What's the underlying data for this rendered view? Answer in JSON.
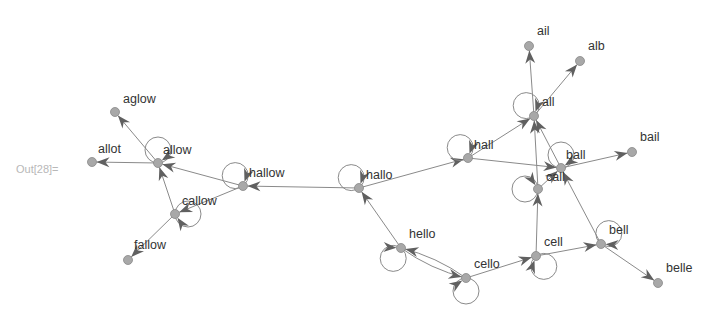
{
  "cell_label": "Out[28]=",
  "graph": {
    "nodes": [
      {
        "id": "aglow",
        "label": "aglow",
        "x": 115,
        "y": 112,
        "lx": 8,
        "ly": -9,
        "loop": null
      },
      {
        "id": "allot",
        "label": "allot",
        "x": 92,
        "y": 162,
        "lx": 6,
        "ly": -9,
        "loop": null
      },
      {
        "id": "allow",
        "label": "allow",
        "x": 158,
        "y": 163,
        "lx": 5,
        "ly": -9,
        "loop": "up"
      },
      {
        "id": "hallow",
        "label": "hallow",
        "x": 243,
        "y": 186,
        "lx": 6,
        "ly": -9,
        "loop": "upleft"
      },
      {
        "id": "callow",
        "label": "callow",
        "x": 175,
        "y": 214,
        "lx": 7,
        "ly": -9,
        "loop": "right"
      },
      {
        "id": "fallow",
        "label": "fallow",
        "x": 128,
        "y": 260,
        "lx": 6,
        "ly": -11,
        "loop": null
      },
      {
        "id": "hallo",
        "label": "hallo",
        "x": 359,
        "y": 188,
        "lx": 7,
        "ly": -9,
        "loop": "upleft"
      },
      {
        "id": "hall",
        "label": "hall",
        "x": 468,
        "y": 158,
        "lx": 6,
        "ly": -9,
        "loop": "upleft"
      },
      {
        "id": "hello",
        "label": "hello",
        "x": 401,
        "y": 248,
        "lx": 8,
        "ly": -10,
        "loop": "downleft"
      },
      {
        "id": "cello",
        "label": "cello",
        "x": 466,
        "y": 278,
        "lx": 8,
        "ly": -10,
        "loop": "down"
      },
      {
        "id": "cell",
        "label": "cell",
        "x": 536,
        "y": 256,
        "lx": 8,
        "ly": -10,
        "loop": "downright"
      },
      {
        "id": "all",
        "label": "all",
        "x": 534,
        "y": 116,
        "lx": 8,
        "ly": -10,
        "loop": "upleft"
      },
      {
        "id": "ail",
        "label": "ail",
        "x": 529,
        "y": 46,
        "lx": 8,
        "ly": -11,
        "loop": null
      },
      {
        "id": "alb",
        "label": "alb",
        "x": 580,
        "y": 61,
        "lx": 8,
        "ly": -11,
        "loop": null
      },
      {
        "id": "ball",
        "label": "ball",
        "x": 561,
        "y": 168,
        "lx": 5,
        "ly": -9,
        "loop": "up"
      },
      {
        "id": "call",
        "label": "call",
        "x": 538,
        "y": 189,
        "lx": 8,
        "ly": -8,
        "loop": "left"
      },
      {
        "id": "bail",
        "label": "bail",
        "x": 632,
        "y": 152,
        "lx": 8,
        "ly": -11,
        "loop": null
      },
      {
        "id": "bell",
        "label": "bell",
        "x": 601,
        "y": 244,
        "lx": 8,
        "ly": -10,
        "loop": "upright"
      },
      {
        "id": "belle",
        "label": "belle",
        "x": 658,
        "y": 283,
        "lx": 8,
        "ly": -11,
        "loop": null
      }
    ],
    "edges": [
      {
        "from": "allow",
        "to": "aglow"
      },
      {
        "from": "allow",
        "to": "allot"
      },
      {
        "from": "hallow",
        "to": "allow"
      },
      {
        "from": "hallow",
        "to": "callow"
      },
      {
        "from": "callow",
        "to": "allow"
      },
      {
        "from": "callow",
        "to": "fallow"
      },
      {
        "from": "hallo",
        "to": "hallow"
      },
      {
        "from": "hallo",
        "to": "hall"
      },
      {
        "from": "hello",
        "to": "hallo"
      },
      {
        "from": "hello",
        "to": "cello",
        "curve": 1
      },
      {
        "from": "cello",
        "to": "hello",
        "curve": 1
      },
      {
        "from": "cello",
        "to": "cell"
      },
      {
        "from": "hall",
        "to": "all"
      },
      {
        "from": "hall",
        "to": "ball"
      },
      {
        "from": "all",
        "to": "ail"
      },
      {
        "from": "all",
        "to": "alb"
      },
      {
        "from": "call",
        "to": "all"
      },
      {
        "from": "ball",
        "to": "all"
      },
      {
        "from": "call",
        "to": "ball"
      },
      {
        "from": "ball",
        "to": "bail"
      },
      {
        "from": "cell",
        "to": "call"
      },
      {
        "from": "cell",
        "to": "bell"
      },
      {
        "from": "bell",
        "to": "ball"
      },
      {
        "from": "bell",
        "to": "belle"
      }
    ]
  },
  "colors": {
    "edge": "#8a8a8a",
    "arrow": "#606060",
    "node_fill": "#a8a8a8",
    "label": "#333333",
    "out_label": "#b8b8b8"
  }
}
